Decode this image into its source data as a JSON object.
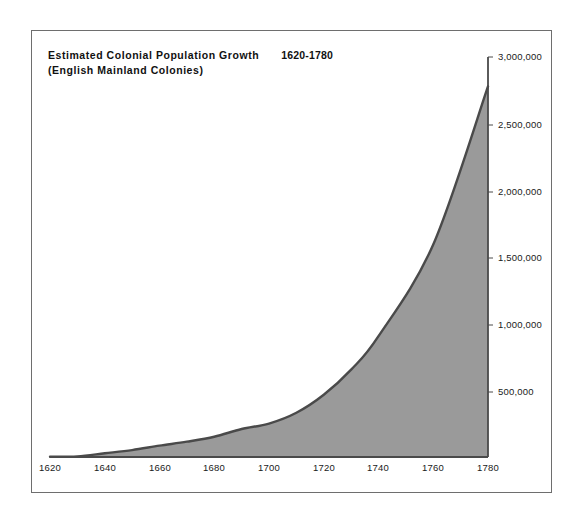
{
  "figure": {
    "title_main": "Estimated Colonial Population Growth",
    "title_range": "1620-1780",
    "subtitle": "(English Mainland Colonies)"
  },
  "colors": {
    "area_fill": "#9a9a9a",
    "curve_stroke": "#4a4a4a",
    "gridline": "#555555",
    "frame": "#6e6e6e",
    "text": "#111111"
  },
  "chart_data": {
    "type": "area",
    "subtitle": "(English Mainland Colonies)",
    "xlabel": "",
    "ylabel": "",
    "grid": true,
    "legend": "none",
    "xlim": [
      1620,
      1780
    ],
    "ylim": [
      0,
      3000000
    ],
    "xticks": [
      1620,
      1640,
      1660,
      1680,
      1700,
      1720,
      1740,
      1760,
      1780
    ],
    "xtick_labels": [
      "1620",
      "1640",
      "1660",
      "1680",
      "1700",
      "1720",
      "1740",
      "1760",
      "1780"
    ],
    "yticks": [
      500000,
      1000000,
      1500000,
      2000000,
      2500000,
      3000000
    ],
    "ytick_labels": [
      "500,000",
      "1,000,000",
      "1,500,000",
      "2,000,000",
      "2,500,000",
      "3,000,000"
    ],
    "x": [
      1620,
      1630,
      1640,
      1650,
      1660,
      1670,
      1680,
      1690,
      1700,
      1710,
      1720,
      1730,
      1740,
      1760,
      1780
    ],
    "values": [
      2000,
      5000,
      28000,
      52000,
      85000,
      115000,
      152000,
      210000,
      251000,
      332000,
      467000,
      655000,
      906000,
      1594000,
      2780000
    ],
    "series": [
      {
        "name": "Estimated colonial population",
        "values": [
          2000,
          5000,
          28000,
          52000,
          85000,
          115000,
          152000,
          210000,
          251000,
          332000,
          467000,
          655000,
          906000,
          1594000,
          2780000
        ]
      }
    ]
  },
  "axes": {
    "y_tick_positions_px": [
      392,
      325,
      258,
      192,
      125,
      57
    ],
    "x_tick_positions_px": [
      50,
      105,
      160,
      214,
      269,
      324,
      378,
      433,
      488
    ],
    "baseline_px": 457
  }
}
